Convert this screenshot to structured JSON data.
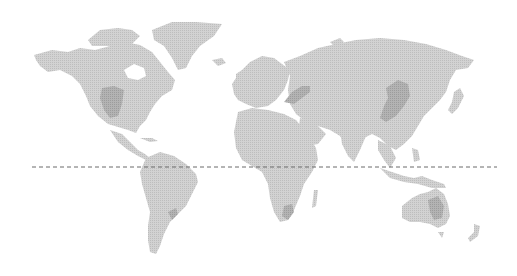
{
  "map": {
    "type": "dotted-world-map",
    "land_color": "#c8c8c8",
    "highlight_color": "#a9a9a9",
    "background": "#ffffff",
    "equator": {
      "style": "dashed",
      "color": "#6a6a6a",
      "y": 167,
      "x_start": 32,
      "x_end": 497
    },
    "highlighted_regions": [
      {
        "name": "US Midwest / Corn Belt"
      },
      {
        "name": "Ukraine / Black Sea"
      },
      {
        "name": "Northeast China"
      },
      {
        "name": "Southern Brazil / Argentina"
      },
      {
        "name": "South Africa"
      },
      {
        "name": "Eastern Australia"
      }
    ]
  }
}
